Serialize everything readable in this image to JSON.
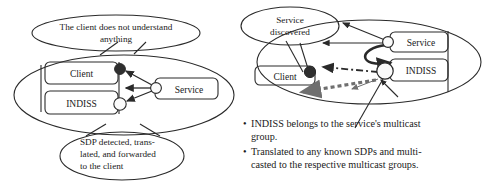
{
  "figure": {
    "type": "diagram",
    "background_color": "#ffffff",
    "line_color": "#2a2a2a",
    "text_color": "#1a1a1a",
    "accent_gray": "#6f6f6f"
  },
  "left_panel": {
    "name": "left-scenario",
    "callout_top": {
      "name": "callout-client-does-not-understand",
      "line1": "The client does not understand",
      "line2": "anything"
    },
    "callout_bottom": {
      "name": "callout-sdp-detected",
      "line1": "SDP detected, trans-",
      "line2": "lated, and forwarded",
      "line3": "to the client"
    },
    "boxes": [
      {
        "name": "box-client",
        "label": "Client"
      },
      {
        "name": "box-indiss",
        "label": "INDISS"
      },
      {
        "name": "box-service",
        "label": "Service"
      }
    ],
    "ports": [
      {
        "name": "port-client",
        "fill": "dark"
      },
      {
        "name": "port-indiss",
        "fill": "light"
      },
      {
        "name": "port-service",
        "fill": "light"
      }
    ]
  },
  "right_panel": {
    "name": "right-scenario",
    "callout": {
      "name": "callout-service-discovered",
      "line1": "Service",
      "line2": "discovered"
    },
    "boxes": [
      {
        "name": "box-client",
        "label": "Client"
      },
      {
        "name": "box-service",
        "label": "Service"
      },
      {
        "name": "box-indiss",
        "label": "INDISS"
      }
    ],
    "ports": [
      {
        "name": "port-client",
        "fill": "dark"
      },
      {
        "name": "port-service",
        "fill": "light"
      },
      {
        "name": "port-indiss",
        "fill": "light"
      }
    ],
    "bullets": [
      {
        "name": "bullet-indiss-multicast-group",
        "marker": "•",
        "line1": "INDISS belongs to the service's multicast",
        "line2": "group."
      },
      {
        "name": "bullet-translated-sdps",
        "marker": "•",
        "line1": "Translated to any known SDPs and multi-",
        "line2": "casted to the respective multicast groups."
      }
    ]
  }
}
